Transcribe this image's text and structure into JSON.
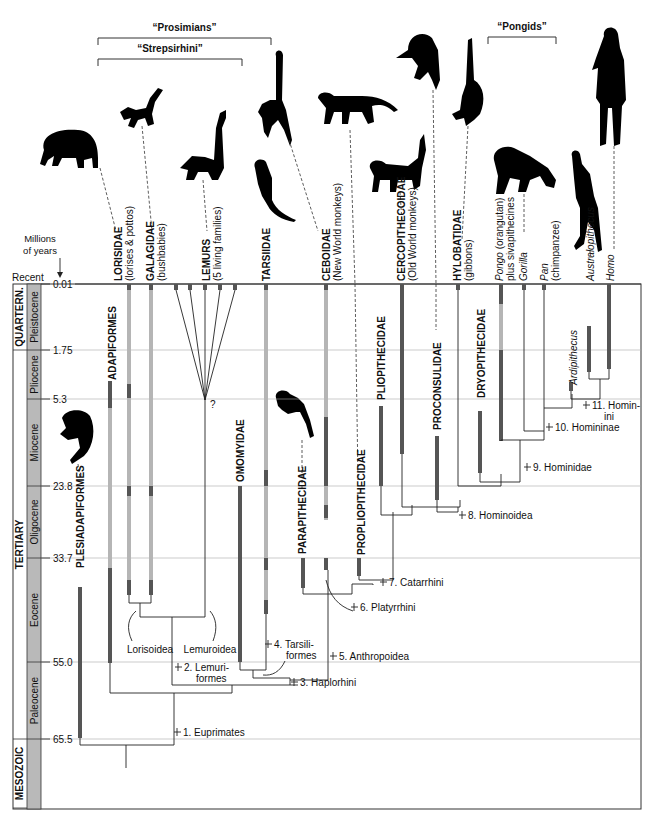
{
  "figure": {
    "groups": [
      {
        "label": "“Prosimians”",
        "x1": 98,
        "x2": 271,
        "y": 31
      },
      {
        "label": "“Strepsirhini”",
        "x1": 98,
        "x2": 242,
        "y": 52
      },
      {
        "label": "“Pongids”",
        "x1": 488,
        "x2": 556,
        "y": 30
      }
    ],
    "axis": {
      "title_line1": "Millions",
      "title_line2": "of years",
      "recent_label": "Recent",
      "ticks": [
        {
          "label": "0.01",
          "y": 284
        },
        {
          "label": "1.75",
          "y": 350
        },
        {
          "label": "5.3",
          "y": 399
        },
        {
          "label": "23.8",
          "y": 486
        },
        {
          "label": "33.7",
          "y": 558
        },
        {
          "label": "55.0",
          "y": 662
        },
        {
          "label": "65.5",
          "y": 739
        }
      ]
    },
    "eras": [
      {
        "label": "QUARTERN.",
        "y1": 284,
        "y2": 350
      },
      {
        "label": "TERTIARY",
        "y1": 350,
        "y2": 739
      },
      {
        "label": "MESOZOIC",
        "y1": 739,
        "y2": 808
      }
    ],
    "epochs": [
      {
        "label": "Pleistocene",
        "y1": 284,
        "y2": 350
      },
      {
        "label": "Pliocene",
        "y1": 350,
        "y2": 399
      },
      {
        "label": "Miocene",
        "y1": 399,
        "y2": 486
      },
      {
        "label": "Oligocene",
        "y1": 486,
        "y2": 558
      },
      {
        "label": "Eocene",
        "y1": 558,
        "y2": 662
      },
      {
        "label": "Paleocene",
        "y1": 662,
        "y2": 739
      }
    ],
    "taxa_header": [
      {
        "name": "LORISIDAE",
        "common": "(lorises & pottos)",
        "x": 118
      },
      {
        "name": "GALAGIDAE",
        "common": "(bushbabies)",
        "x": 150
      },
      {
        "name": "LEMURS",
        "common": "(5 living families)",
        "x": 206
      },
      {
        "name": "TARSIIDAE",
        "common": "",
        "x": 266
      },
      {
        "name": "CEBOIDAE",
        "common": "(New World monkeys)",
        "x": 326
      },
      {
        "name": "CERCOPITHECOIDAE",
        "common": "(Old World monkeys)",
        "x": 401
      },
      {
        "name": "HYLOBATIDAE",
        "common": "(gibbons)",
        "x": 457
      },
      {
        "name": "Pongo",
        "common": "(orangutan) plus sivapithecines",
        "x": 499,
        "italic": true
      },
      {
        "name": "Gorilla",
        "common": "",
        "x": 523,
        "italic": true
      },
      {
        "name": "Pan",
        "common": "(chimpanzee)",
        "x": 544,
        "italic": true
      },
      {
        "name": "Australopithecus",
        "common": "",
        "x": 590,
        "italic": true
      },
      {
        "name": "Homo",
        "common": "",
        "x": 610,
        "italic": true
      }
    ],
    "taxa_inline": [
      {
        "name": "ADAPIFORMES",
        "x": 112,
        "y": 380
      },
      {
        "name": "PLESIADAPIFORMES",
        "x": 80,
        "y": 568
      },
      {
        "name": "OMOMYIDAE",
        "x": 240,
        "y": 482
      },
      {
        "name": "PARAPITHECIDAE",
        "x": 302,
        "y": 554
      },
      {
        "name": "PROPLIOPITHECIDAE",
        "x": 361,
        "y": 555
      },
      {
        "name": "PLIOPITHECIDAE",
        "x": 381,
        "y": 400
      },
      {
        "name": "PROCONSULIDAE",
        "x": 437,
        "y": 430
      },
      {
        "name": "DRYOPITHECIDAE",
        "x": 481,
        "y": 398
      },
      {
        "name": "Ardipithecus",
        "x": 573,
        "y": 385,
        "italic": true
      }
    ],
    "clades": [
      {
        "label": "1. Euprimates",
        "x": 181,
        "y": 736
      },
      {
        "label": "2. Lemuri-",
        "label2": "formes",
        "x": 182,
        "y": 671
      },
      {
        "label": "3. Haplorhini",
        "x": 298,
        "y": 686
      },
      {
        "label": "4. Tarsili-",
        "label2": "formes",
        "x": 272,
        "y": 648
      },
      {
        "label": "5. Anthropoidea",
        "x": 337,
        "y": 660
      },
      {
        "label": "6. Platyrrhini",
        "x": 358,
        "y": 611
      },
      {
        "label": "7. Catarrhini",
        "x": 387,
        "y": 586
      },
      {
        "label": "8. Hominoidea",
        "x": 466,
        "y": 519
      },
      {
        "label": "9. Hominidae",
        "x": 531,
        "y": 471
      },
      {
        "label": "10. Homininae",
        "x": 553,
        "y": 431
      },
      {
        "label": "11. Homin-",
        "label2": "ini",
        "x": 590,
        "y": 409
      }
    ],
    "superfamilies": [
      {
        "label": "Lorisoidea",
        "x": 150,
        "y": 653
      },
      {
        "label": "Lemuroidea",
        "x": 210,
        "y": 653
      }
    ],
    "question_mark": "?",
    "silhouettes": [
      {
        "name": "adapiform",
        "x": 72,
        "y": 150
      },
      {
        "name": "galago",
        "x": 118,
        "y": 105
      },
      {
        "name": "lemur",
        "x": 198,
        "y": 170
      },
      {
        "name": "spider-monkey-like",
        "x": 270,
        "y": 110
      },
      {
        "name": "tarsier",
        "x": 265,
        "y": 188
      },
      {
        "name": "ceboid-monkey",
        "x": 345,
        "y": 110
      },
      {
        "name": "cercopithecoid-monkey",
        "x": 385,
        "y": 160
      },
      {
        "name": "proconsul",
        "x": 420,
        "y": 40
      },
      {
        "name": "gibbon",
        "x": 465,
        "y": 60
      },
      {
        "name": "chimpanzee",
        "x": 520,
        "y": 170
      },
      {
        "name": "australopithecine",
        "x": 585,
        "y": 185
      },
      {
        "name": "human",
        "x": 615,
        "y": 60
      },
      {
        "name": "plesiadapiform",
        "x": 80,
        "y": 445
      },
      {
        "name": "parapithecid",
        "x": 295,
        "y": 380
      }
    ]
  },
  "colors": {
    "dark_bar": "#555555",
    "light_bar": "#b5b5b5",
    "epoch_fill": "#b9b9b9",
    "grid": "#aaaaaa",
    "line": "#222222"
  }
}
